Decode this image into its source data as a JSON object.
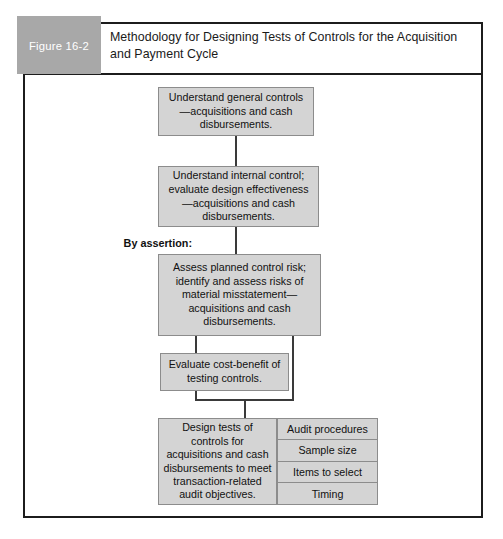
{
  "figure": {
    "tab_label": "Figure 16-2",
    "title": "Methodology for Designing Tests of Controls for the Acquisition and Payment Cycle"
  },
  "annotations": {
    "by_assertion": "By assertion:"
  },
  "flow": {
    "steps": [
      {
        "id": "understand-general-controls",
        "text": "Understand general controls—acquisitions and cash disbursements."
      },
      {
        "id": "understand-internal-control",
        "text": "Understand internal control; evaluate design effectiveness—acquisitions and cash disbursements."
      },
      {
        "id": "assess-planned-control-risk",
        "text": "Assess planned control risk; identify and assess risks of material misstatement—acquisitions and cash disbursements."
      },
      {
        "id": "evaluate-cost-benefit",
        "text": "Evaluate cost-benefit of testing controls."
      },
      {
        "id": "design-tests-of-controls",
        "text": "Design tests of controls for acquisitions and cash disbursements to meet transaction-related audit objectives."
      }
    ],
    "audit_procedure_cells": [
      "Audit procedures",
      "Sample size",
      "Items to select",
      "Timing"
    ]
  },
  "colors": {
    "box_fill": "#d4d4d4",
    "box_border": "#8c8c8c",
    "frame_border": "#1c1c1c",
    "tab_fill": "#a8a8a8",
    "connector": "#3a3a3a"
  }
}
